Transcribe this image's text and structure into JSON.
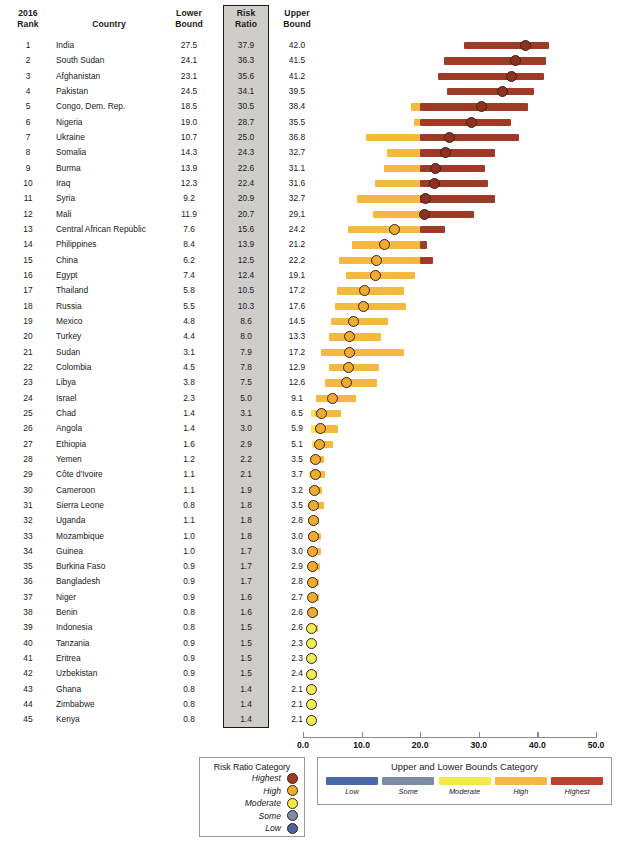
{
  "top_title": "",
  "header": {
    "rank": "2016\nRank",
    "rank_line1": "2016",
    "rank_line2": "Rank",
    "country": "Country",
    "lower_line1": "Lower",
    "lower_line2": "Bound",
    "risk_line1": "Risk",
    "risk_line2": "Ratio",
    "upper_line1": "Upper",
    "upper_line2": "Bound"
  },
  "axis": {
    "min": 0,
    "max": 50,
    "ticks": [
      "0.0",
      "10.0",
      "20.0",
      "30.0",
      "40.0",
      "50.0"
    ],
    "tick_values": [
      0,
      10,
      20,
      30,
      40,
      50
    ]
  },
  "colors": {
    "highest": "#9e3b26",
    "high": "#f5b841",
    "moderate": "#f2ea4a",
    "some": "#7d8ba3",
    "low": "#4f63a0",
    "marker_highest": "#8d3222",
    "marker_high": "#f0ab33",
    "marker_moderate": "#f0ec55",
    "marker_some": "#7d8ba3",
    "marker_low": "#4f63a0",
    "risk_column_fill": "#cfcdc9"
  },
  "legend_risk": {
    "title": "Risk Ratio Category",
    "items": [
      {
        "label": "Highest",
        "color": "#9e3b26"
      },
      {
        "label": "High",
        "color": "#f0ab33"
      },
      {
        "label": "Moderate",
        "color": "#f2ea4a"
      },
      {
        "label": "Some",
        "color": "#7d8ba3"
      },
      {
        "label": "Low",
        "color": "#4f63a0"
      }
    ]
  },
  "legend_bounds": {
    "title": "Upper and Lower Bounds Category",
    "items": [
      {
        "label": "Low",
        "color": "#4a68a8"
      },
      {
        "label": "Some",
        "color": "#7d8ba3"
      },
      {
        "label": "Moderate",
        "color": "#f2ea4a"
      },
      {
        "label": "High",
        "color": "#f5b841"
      },
      {
        "label": "Highest",
        "color": "#b8432c"
      }
    ]
  },
  "chart_data": {
    "type": "bar",
    "title": "",
    "xlabel": "",
    "ylabel": "",
    "xlim": [
      0,
      50
    ],
    "grid": false,
    "legend_position": "bottom",
    "columns": [
      "2016 Rank",
      "Country",
      "Lower Bound",
      "Risk Ratio",
      "Upper Bound"
    ],
    "rows": [
      {
        "rank": 1,
        "country": "India",
        "lower": 27.5,
        "risk": 37.9,
        "upper": 42.0
      },
      {
        "rank": 2,
        "country": "South Sudan",
        "lower": 24.1,
        "risk": 36.3,
        "upper": 41.5
      },
      {
        "rank": 3,
        "country": "Afghanistan",
        "lower": 23.1,
        "risk": 35.6,
        "upper": 41.2
      },
      {
        "rank": 4,
        "country": "Pakistan",
        "lower": 24.5,
        "risk": 34.1,
        "upper": 39.5
      },
      {
        "rank": 5,
        "country": "Congo, Dem. Rep.",
        "lower": 18.5,
        "risk": 30.5,
        "upper": 38.4
      },
      {
        "rank": 6,
        "country": "Nigeria",
        "lower": 19.0,
        "risk": 28.7,
        "upper": 35.5
      },
      {
        "rank": 7,
        "country": "Ukraine",
        "lower": 10.7,
        "risk": 25.0,
        "upper": 36.8
      },
      {
        "rank": 8,
        "country": "Somalia",
        "lower": 14.3,
        "risk": 24.3,
        "upper": 32.7
      },
      {
        "rank": 9,
        "country": "Burma",
        "lower": 13.9,
        "risk": 22.6,
        "upper": 31.1
      },
      {
        "rank": 10,
        "country": "Iraq",
        "lower": 12.3,
        "risk": 22.4,
        "upper": 31.6
      },
      {
        "rank": 11,
        "country": "Syria",
        "lower": 9.2,
        "risk": 20.9,
        "upper": 32.7
      },
      {
        "rank": 12,
        "country": "Mali",
        "lower": 11.9,
        "risk": 20.7,
        "upper": 29.1
      },
      {
        "rank": 13,
        "country": "Central African Republic",
        "lower": 7.6,
        "risk": 15.6,
        "upper": 24.2
      },
      {
        "rank": 14,
        "country": "Philippines",
        "lower": 8.4,
        "risk": 13.9,
        "upper": 21.2
      },
      {
        "rank": 15,
        "country": "China",
        "lower": 6.2,
        "risk": 12.5,
        "upper": 22.2
      },
      {
        "rank": 16,
        "country": "Egypt",
        "lower": 7.4,
        "risk": 12.4,
        "upper": 19.1
      },
      {
        "rank": 17,
        "country": "Thailand",
        "lower": 5.8,
        "risk": 10.5,
        "upper": 17.2
      },
      {
        "rank": 18,
        "country": "Russia",
        "lower": 5.5,
        "risk": 10.3,
        "upper": 17.6
      },
      {
        "rank": 19,
        "country": "Mexico",
        "lower": 4.8,
        "risk": 8.6,
        "upper": 14.5
      },
      {
        "rank": 20,
        "country": "Turkey",
        "lower": 4.4,
        "risk": 8.0,
        "upper": 13.3
      },
      {
        "rank": 21,
        "country": "Sudan",
        "lower": 3.1,
        "risk": 7.9,
        "upper": 17.2
      },
      {
        "rank": 22,
        "country": "Colombia",
        "lower": 4.5,
        "risk": 7.8,
        "upper": 12.9
      },
      {
        "rank": 23,
        "country": "Libya",
        "lower": 3.8,
        "risk": 7.5,
        "upper": 12.6
      },
      {
        "rank": 24,
        "country": "Israel",
        "lower": 2.3,
        "risk": 5.0,
        "upper": 9.1
      },
      {
        "rank": 25,
        "country": "Chad",
        "lower": 1.4,
        "risk": 3.1,
        "upper": 6.5
      },
      {
        "rank": 26,
        "country": "Angola",
        "lower": 1.4,
        "risk": 3.0,
        "upper": 5.9
      },
      {
        "rank": 27,
        "country": "Ethiopia",
        "lower": 1.6,
        "risk": 2.9,
        "upper": 5.1
      },
      {
        "rank": 28,
        "country": "Yemen",
        "lower": 1.2,
        "risk": 2.2,
        "upper": 3.5
      },
      {
        "rank": 29,
        "country": "Côte d'Ivoire",
        "lower": 1.1,
        "risk": 2.1,
        "upper": 3.7
      },
      {
        "rank": 30,
        "country": "Cameroon",
        "lower": 1.1,
        "risk": 1.9,
        "upper": 3.2
      },
      {
        "rank": 31,
        "country": "Sierra Leone",
        "lower": 0.8,
        "risk": 1.8,
        "upper": 3.5
      },
      {
        "rank": 32,
        "country": "Uganda",
        "lower": 1.1,
        "risk": 1.8,
        "upper": 2.8
      },
      {
        "rank": 33,
        "country": "Mozambique",
        "lower": 1.0,
        "risk": 1.8,
        "upper": 3.0
      },
      {
        "rank": 34,
        "country": "Guinea",
        "lower": 1.0,
        "risk": 1.7,
        "upper": 3.0
      },
      {
        "rank": 35,
        "country": "Burkina Faso",
        "lower": 0.9,
        "risk": 1.7,
        "upper": 2.9
      },
      {
        "rank": 36,
        "country": "Bangladesh",
        "lower": 0.9,
        "risk": 1.7,
        "upper": 2.8
      },
      {
        "rank": 37,
        "country": "Niger",
        "lower": 0.9,
        "risk": 1.6,
        "upper": 2.7
      },
      {
        "rank": 38,
        "country": "Benin",
        "lower": 0.8,
        "risk": 1.6,
        "upper": 2.6
      },
      {
        "rank": 39,
        "country": "Indonesia",
        "lower": 0.8,
        "risk": 1.5,
        "upper": 2.6
      },
      {
        "rank": 40,
        "country": "Tanzania",
        "lower": 0.9,
        "risk": 1.5,
        "upper": 2.3
      },
      {
        "rank": 41,
        "country": "Eritrea",
        "lower": 0.9,
        "risk": 1.5,
        "upper": 2.3
      },
      {
        "rank": 42,
        "country": "Uzbekistan",
        "lower": 0.9,
        "risk": 1.5,
        "upper": 2.4
      },
      {
        "rank": 43,
        "country": "Ghana",
        "lower": 0.8,
        "risk": 1.4,
        "upper": 2.1
      },
      {
        "rank": 44,
        "country": "Zimbabwe",
        "lower": 0.8,
        "risk": 1.4,
        "upper": 2.1
      },
      {
        "rank": 45,
        "country": "Kenya",
        "lower": 0.8,
        "risk": 1.4,
        "upper": 2.1
      }
    ]
  }
}
